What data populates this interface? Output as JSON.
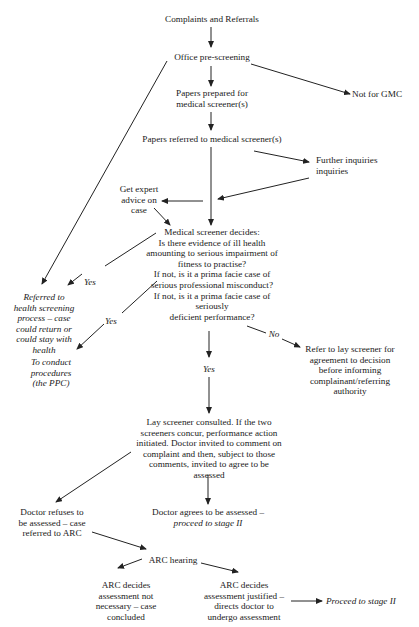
{
  "nodes": {
    "complaints": "Complaints and Referrals",
    "prescreen": "Office pre-screening",
    "not_gmc": "Not for GMC",
    "papers_prepared": [
      "Papers prepared for",
      "medical screener(s)"
    ],
    "papers_referred": "Papers referred to medical screener(s)",
    "further": [
      "Further inquiries",
      "inquiries"
    ],
    "expert": [
      "Get expert",
      "advice on",
      "case"
    ],
    "screener": [
      "Medical screener decides:",
      "Is there evidence of ill health",
      "amounting to serious impairment of",
      "fitness to practise?",
      "If not, is it a prima facie case of",
      "serious professional misconduct?",
      "If not, is it a prima facie case of",
      "seriously",
      "deficient performance?"
    ],
    "health": [
      "Referred to",
      "health screening",
      "process – case",
      "could return or",
      "could stay with",
      "health"
    ],
    "ppc": [
      "To conduct",
      "procedures",
      "(the PPC)"
    ],
    "lay_refer": [
      "Refer to lay screener for",
      "agreement to decision",
      "before informing",
      "complainant/referring",
      "authority"
    ],
    "lay_consulted": [
      "Lay screener consulted. If the two",
      "screeners concur, performance action",
      "initiated. Doctor invited to comment on",
      "complaint and then, subject to those",
      "comments, invited to agree to be",
      "assessed"
    ],
    "refuses": [
      "Doctor refuses to",
      "be assessed – case",
      "referred to ARC"
    ],
    "agrees": [
      "Doctor agrees to be assessed –"
    ],
    "agrees_italic": "proceed to stage II",
    "arc_hearing": "ARC hearing",
    "arc_not": [
      "ARC decides",
      "assessment not",
      "necessary – case",
      "concluded"
    ],
    "arc_just": [
      "ARC decides",
      "assessment justified –",
      "directs doctor to",
      "undergo assessment"
    ],
    "proceed": "Proceed to stage II"
  },
  "edge_labels": {
    "yes_health": "Yes",
    "yes_ppc": "Yes",
    "no": "No",
    "yes_down": "Yes"
  }
}
